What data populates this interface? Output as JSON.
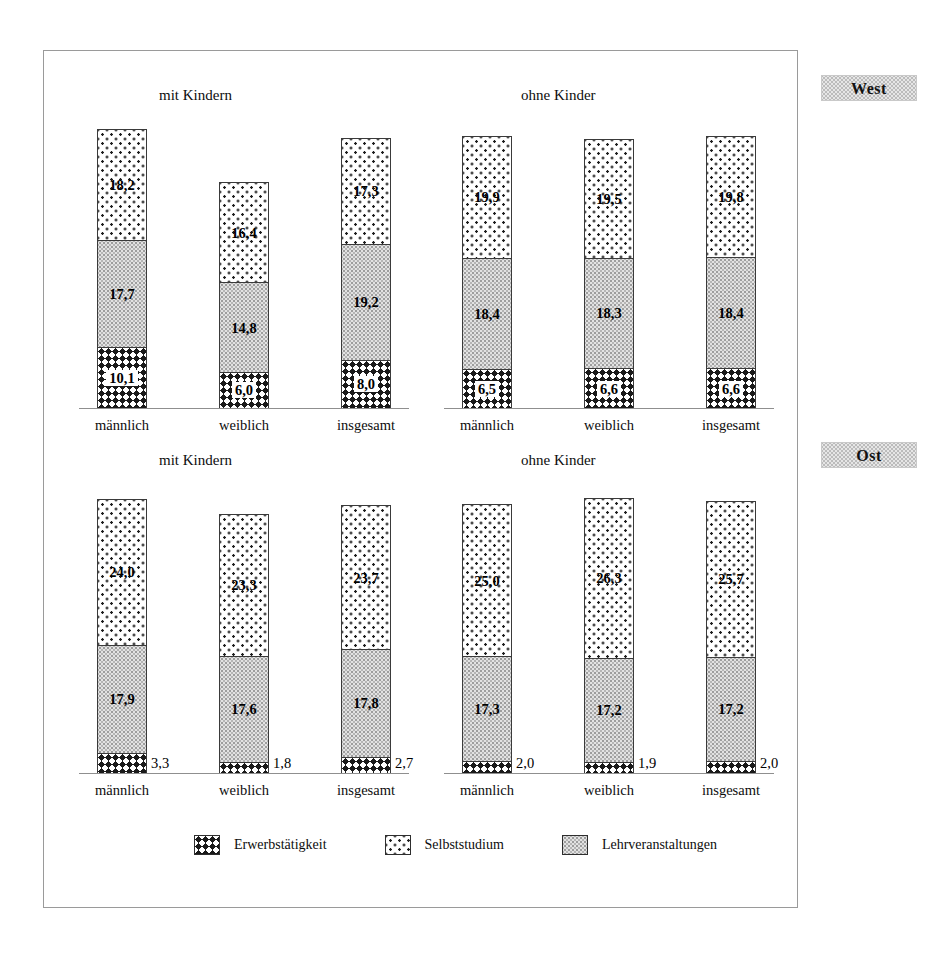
{
  "figure": {
    "region_labels": [
      {
        "name": "west",
        "text": "West"
      },
      {
        "name": "ost",
        "text": "Ost"
      }
    ],
    "legend": [
      {
        "key": "work",
        "label": "Erwerbstätigkeit",
        "pattern": "dark-crosshatch"
      },
      {
        "key": "self",
        "label": "Selbststudium",
        "pattern": "white-sparse-dots"
      },
      {
        "key": "lect",
        "label": "Lehrveranstaltungen",
        "pattern": "gray-stipple"
      }
    ],
    "categories": [
      "männlich",
      "weiblich",
      "insgesamt"
    ],
    "group_titles": [
      "mit Kindern",
      "ohne Kinder"
    ]
  },
  "chart_data": {
    "type": "bar",
    "subtype": "stacked",
    "title": "",
    "xlabel": "",
    "ylabel": "",
    "unit": "Stunden pro Woche",
    "grid": false,
    "legend_position": "bottom",
    "axis_max": 48,
    "categories": [
      "männlich",
      "weiblich",
      "insgesamt"
    ],
    "series": [
      {
        "name": "Erwerbstätigkeit",
        "key": "work"
      },
      {
        "name": "Lehrveranstaltungen",
        "key": "lect"
      },
      {
        "name": "Selbststudium",
        "key": "self"
      }
    ],
    "panels": [
      {
        "region": "West",
        "groups": [
          {
            "title": "mit Kindern",
            "bars": [
              {
                "category": "männlich",
                "work": 10.1,
                "lect": 17.7,
                "self": 18.2,
                "total": 46.0,
                "labels": {
                  "work": "10,1",
                  "lect": "17,7",
                  "self": "18,2"
                },
                "work_label_outside": false
              },
              {
                "category": "weiblich",
                "work": 6.0,
                "lect": 14.8,
                "self": 16.4,
                "total": 37.2,
                "labels": {
                  "work": "6,0",
                  "lect": "14,8",
                  "self": "16,4"
                },
                "work_label_outside": false
              },
              {
                "category": "insgesamt",
                "work": 8.0,
                "lect": 19.2,
                "self": 17.3,
                "total": 44.5,
                "labels": {
                  "work": "8,0",
                  "lect": "19,2",
                  "self": "17,3"
                },
                "work_label_outside": false
              }
            ]
          },
          {
            "title": "ohne Kinder",
            "bars": [
              {
                "category": "männlich",
                "work": 6.5,
                "lect": 18.4,
                "self": 19.9,
                "total": 44.8,
                "labels": {
                  "work": "6,5",
                  "lect": "18,4",
                  "self": "19,9"
                },
                "work_label_outside": false
              },
              {
                "category": "weiblich",
                "work": 6.6,
                "lect": 18.3,
                "self": 19.5,
                "total": 44.4,
                "labels": {
                  "work": "6,6",
                  "lect": "18,3",
                  "self": "19,5"
                },
                "work_label_outside": false
              },
              {
                "category": "insgesamt",
                "work": 6.6,
                "lect": 18.4,
                "self": 19.8,
                "total": 44.8,
                "labels": {
                  "work": "6,6",
                  "lect": "18,4",
                  "self": "19,8"
                },
                "work_label_outside": false
              }
            ]
          }
        ]
      },
      {
        "region": "Ost",
        "groups": [
          {
            "title": "mit Kindern",
            "bars": [
              {
                "category": "männlich",
                "work": 3.3,
                "lect": 17.9,
                "self": 24.0,
                "total": 45.2,
                "labels": {
                  "work": "3,3",
                  "lect": "17,9",
                  "self": "24,0"
                },
                "work_label_outside": true
              },
              {
                "category": "weiblich",
                "work": 1.8,
                "lect": 17.6,
                "self": 23.3,
                "total": 42.7,
                "labels": {
                  "work": "1,8",
                  "lect": "17,6",
                  "self": "23,3"
                },
                "work_label_outside": true
              },
              {
                "category": "insgesamt",
                "work": 2.7,
                "lect": 17.8,
                "self": 23.7,
                "total": 44.2,
                "labels": {
                  "work": "2,7",
                  "lect": "17,8",
                  "self": "23,7"
                },
                "work_label_outside": true
              }
            ]
          },
          {
            "title": "ohne Kinder",
            "bars": [
              {
                "category": "männlich",
                "work": 2.0,
                "lect": 17.3,
                "self": 25.0,
                "total": 44.3,
                "labels": {
                  "work": "2,0",
                  "lect": "17,3",
                  "self": "25,0"
                },
                "work_label_outside": true
              },
              {
                "category": "weiblich",
                "work": 1.9,
                "lect": 17.2,
                "self": 26.3,
                "total": 45.4,
                "labels": {
                  "work": "1,9",
                  "lect": "17,2",
                  "self": "26,3"
                },
                "work_label_outside": true
              },
              {
                "category": "insgesamt",
                "work": 2.0,
                "lect": 17.2,
                "self": 25.7,
                "total": 44.9,
                "labels": {
                  "work": "2,0",
                  "lect": "17,2",
                  "self": "25,7"
                },
                "work_label_outside": true
              }
            ]
          }
        ]
      }
    ]
  }
}
